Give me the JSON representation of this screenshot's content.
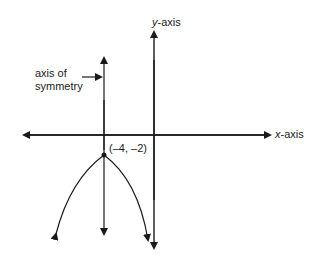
{
  "diagram": {
    "title": "",
    "labels": {
      "y_axis_var": "y",
      "y_axis_suffix": "-axis",
      "x_axis_var": "x",
      "x_axis_suffix": "-axis",
      "axis_of_symmetry_line1": "axis of",
      "axis_of_symmetry_line2": "symmetry",
      "vertex": "(–4, –2)"
    },
    "vertex": {
      "x": -4,
      "y": -2
    },
    "parabola": "opens downward",
    "stroke_color": "#1a1a1a"
  }
}
